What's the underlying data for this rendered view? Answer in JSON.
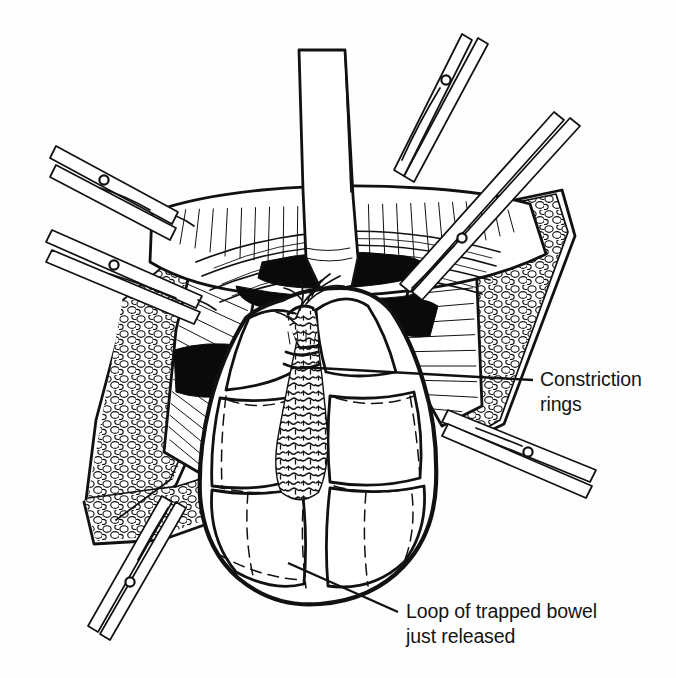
{
  "figure": {
    "kind": "surgical-line-illustration",
    "background_color": "#fefefe",
    "ink_color": "#111111",
    "shadow_color": "#0a0a0a"
  },
  "annotations": [
    {
      "id": "constriction-rings",
      "line1": "Constriction",
      "line2": "rings",
      "text_x": 540,
      "text_y": 386,
      "line_height": 25,
      "leader": {
        "x1": 300,
        "y1": 367,
        "x2": 533,
        "y2": 380
      }
    },
    {
      "id": "loop-of-trapped-bowel",
      "line1": "Loop of trapped bowel",
      "line2": "just released",
      "text_x": 406,
      "text_y": 618,
      "line_height": 25,
      "leader": {
        "x1": 288,
        "y1": 563,
        "x2": 398,
        "y2": 612
      }
    }
  ],
  "structures": [
    {
      "name": "retractor-blade-center",
      "type": "instrument",
      "count": 1
    },
    {
      "name": "hemostat-clamp",
      "type": "instrument",
      "count": 6
    },
    {
      "name": "wound-edge-skin",
      "type": "tissue"
    },
    {
      "name": "subcutaneous-fat",
      "type": "tissue"
    },
    {
      "name": "muscle-layer",
      "type": "tissue"
    },
    {
      "name": "peritoneal-cavity-shadow",
      "type": "tissue"
    },
    {
      "name": "bowel-loop",
      "type": "tissue"
    },
    {
      "name": "mesentery",
      "type": "tissue"
    },
    {
      "name": "mesenteric-vessels",
      "type": "tissue"
    },
    {
      "name": "constriction-ring-band",
      "type": "tissue"
    }
  ]
}
